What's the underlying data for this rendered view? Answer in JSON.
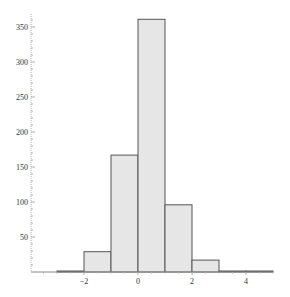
{
  "chart_data": {
    "type": "bar",
    "subtype": "histogram",
    "title": "",
    "xlabel": "",
    "ylabel": "",
    "bins": [
      {
        "x0": -3,
        "x1": -2,
        "count": 1
      },
      {
        "x0": -2,
        "x1": -1,
        "count": 29
      },
      {
        "x0": -1,
        "x1": 0,
        "count": 167
      },
      {
        "x0": 0,
        "x1": 1,
        "count": 361
      },
      {
        "x0": 1,
        "x1": 2,
        "count": 96
      },
      {
        "x0": 2,
        "x1": 3,
        "count": 17
      },
      {
        "x0": 3,
        "x1": 4,
        "count": 1
      },
      {
        "x0": 4,
        "x1": 5,
        "count": 1
      }
    ],
    "categories": [
      "-3..-2",
      "-2..-1",
      "-1..0",
      "0..1",
      "1..2",
      "2..3",
      "3..4",
      "4..5"
    ],
    "values": [
      1,
      29,
      167,
      361,
      96,
      17,
      1,
      1
    ],
    "xlim": [
      -4,
      5
    ],
    "ylim": [
      0,
      365
    ],
    "x_ticks": [
      -2,
      0,
      2,
      4
    ],
    "x_tick_labels": [
      "−2",
      "0",
      "2",
      "4"
    ],
    "y_ticks": [
      50,
      100,
      150,
      200,
      250,
      300,
      350
    ],
    "y_tick_labels": [
      "50",
      "100",
      "150",
      "200",
      "250",
      "300",
      "350"
    ],
    "grid": false,
    "legend": null,
    "colors": {
      "bar_fill": "#e6e6e6",
      "bar_stroke": "#555555",
      "axis": "#b0b0b0"
    }
  }
}
